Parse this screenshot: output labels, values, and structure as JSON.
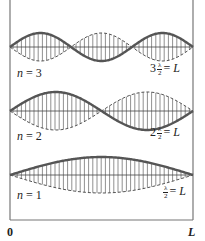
{
  "diagram": {
    "colors": {
      "wave": "#555555",
      "lines": "#444444",
      "walls": "#777777"
    },
    "modes": [
      {
        "n": 3,
        "label_n": "n = 3",
        "coef": "3",
        "frac_num": "λ",
        "frac_den": "2",
        "equals": "= L",
        "baseline_y": 47,
        "amplitude": 14
      },
      {
        "n": 2,
        "label_n": "n = 2",
        "coef": "2",
        "frac_num": "λ",
        "frac_den": "2",
        "equals": "= L",
        "baseline_y": 111,
        "amplitude": 19
      },
      {
        "n": 1,
        "label_n": "n = 1",
        "coef": "",
        "frac_num": "λ",
        "frac_den": "2",
        "equals": "= L",
        "baseline_y": 175,
        "amplitude": 18
      }
    ],
    "axis": {
      "left_label": "0",
      "right_label": "L"
    }
  }
}
